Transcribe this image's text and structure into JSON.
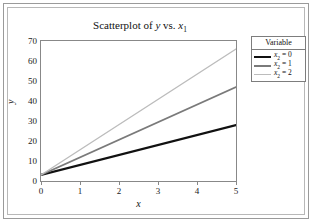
{
  "chart_data": {
    "type": "line",
    "title": "Scatterplot of y vs. x1",
    "title_parts": {
      "prefix": "Scatterplot of ",
      "yvar": "y",
      "middle": " vs. ",
      "xvar": "x",
      "xvar_sub": "1"
    },
    "xlabel": "x",
    "ylabel": "y",
    "xlim": [
      0,
      5
    ],
    "ylim": [
      0,
      70
    ],
    "xticks": [
      0,
      1,
      2,
      3,
      4,
      5
    ],
    "yticks": [
      0,
      10,
      20,
      30,
      40,
      50,
      60,
      70
    ],
    "grid": false,
    "legend_position": "outside-right-top",
    "legend_title": "Variable",
    "x": [
      0,
      5
    ],
    "series": [
      {
        "name": "x2 = 0",
        "label_var": "x",
        "label_sub": "2",
        "label_value": "0",
        "color": "#111111",
        "width": 2.2,
        "values": [
          3,
          28
        ]
      },
      {
        "name": "x2 = 1",
        "label_var": "x",
        "label_sub": "2",
        "label_value": "1",
        "color": "#7a7a7a",
        "width": 1.6,
        "values": [
          3,
          47
        ]
      },
      {
        "name": "x2 = 2",
        "label_var": "x",
        "label_sub": "2",
        "label_value": "2",
        "color": "#bcbcbc",
        "width": 1.3,
        "values": [
          3,
          66
        ]
      }
    ]
  },
  "figure": {
    "background": "#ffffff",
    "frame_color": "#9a9a9a",
    "panel_border": "#888888"
  }
}
